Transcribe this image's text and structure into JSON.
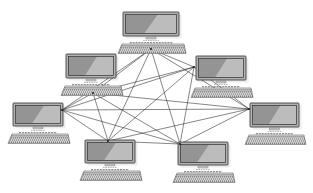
{
  "diagram": {
    "type": "mesh-network-topology",
    "node_count": 7,
    "icons": {
      "node": "desktop-computer-icon",
      "node_parts": [
        "monitor-icon",
        "keyboard-icon"
      ]
    },
    "canvas": {
      "width": 313,
      "height": 193
    },
    "nodes": [
      {
        "id": "computer-1",
        "position": "top-center",
        "x": 123,
        "y": 12,
        "w": 56,
        "h": 24,
        "port_x": 151,
        "port_y": 49
      },
      {
        "id": "computer-2",
        "position": "upper-left",
        "x": 66,
        "y": 54,
        "w": 50,
        "h": 24,
        "port_x": 93,
        "port_y": 93
      },
      {
        "id": "computer-3",
        "position": "upper-right",
        "x": 196,
        "y": 56,
        "w": 50,
        "h": 24,
        "port_x": 194,
        "port_y": 67
      },
      {
        "id": "computer-4",
        "position": "middle-left",
        "x": 13,
        "y": 103,
        "w": 50,
        "h": 23,
        "port_x": 62,
        "port_y": 110
      },
      {
        "id": "computer-5",
        "position": "middle-right",
        "x": 250,
        "y": 103,
        "w": 49,
        "h": 24,
        "port_x": 249,
        "port_y": 109
      },
      {
        "id": "computer-6",
        "position": "bottom-left",
        "x": 85,
        "y": 140,
        "w": 50,
        "h": 23,
        "port_x": 108,
        "port_y": 141
      },
      {
        "id": "computer-7",
        "position": "bottom-right",
        "x": 178,
        "y": 142,
        "w": 50,
        "h": 23,
        "port_x": 180,
        "port_y": 144
      }
    ],
    "edges": [
      [
        0,
        1
      ],
      [
        0,
        2
      ],
      [
        0,
        3
      ],
      [
        0,
        4
      ],
      [
        0,
        5
      ],
      [
        0,
        6
      ],
      [
        1,
        2
      ],
      [
        1,
        3
      ],
      [
        1,
        4
      ],
      [
        1,
        5
      ],
      [
        1,
        6
      ],
      [
        2,
        3
      ],
      [
        2,
        4
      ],
      [
        2,
        5
      ],
      [
        2,
        6
      ],
      [
        3,
        4
      ],
      [
        3,
        5
      ],
      [
        3,
        6
      ],
      [
        4,
        5
      ],
      [
        4,
        6
      ],
      [
        5,
        6
      ]
    ],
    "colors": {
      "background": "#ffffff",
      "line": "#2b2b2b",
      "monitor_frame": "#b2b2b2",
      "screen": "#bcbcbc",
      "keyboard": "#e7e7e7"
    }
  }
}
